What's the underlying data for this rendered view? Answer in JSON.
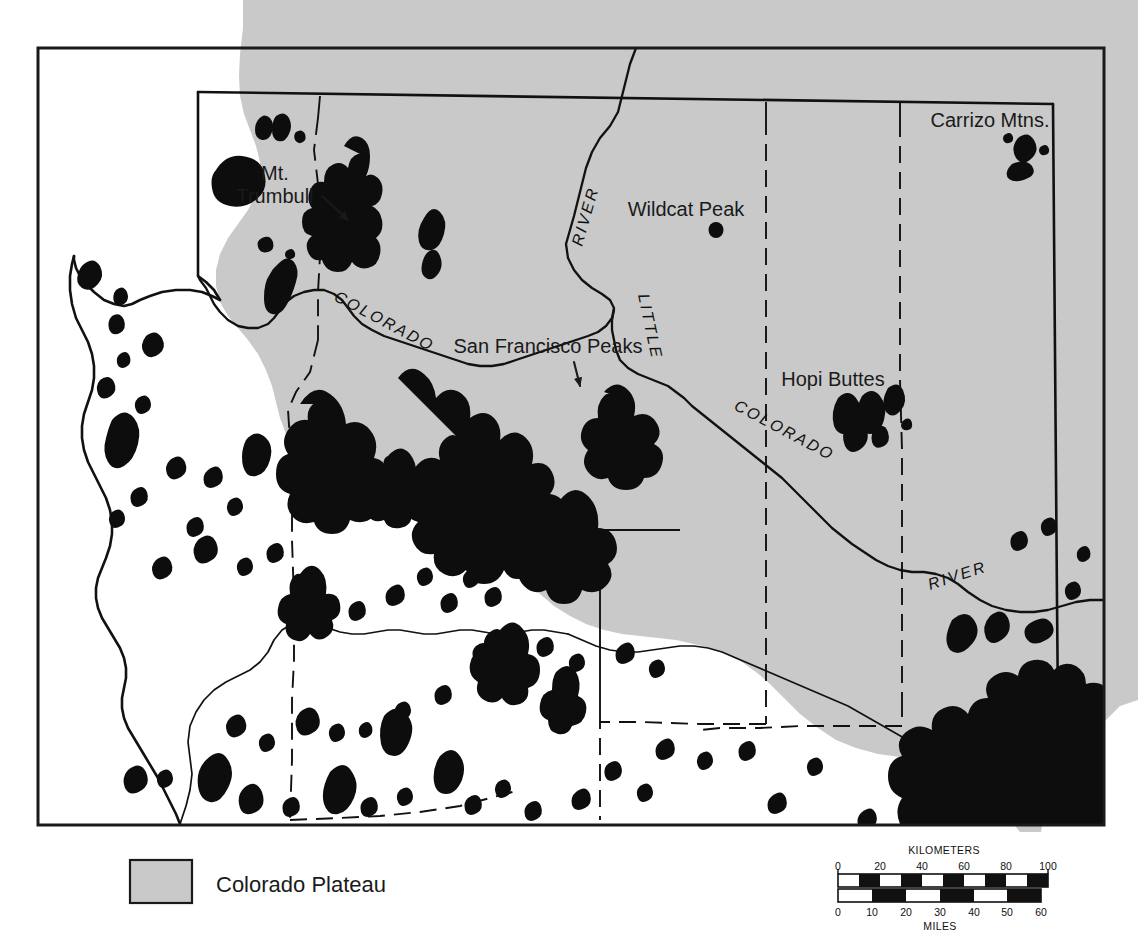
{
  "figure": {
    "background_color": "#ffffff",
    "frame_color": "#1a1a1a"
  },
  "map": {
    "plateau_color": "#c9c9c9",
    "volcanic_field_color": "#0d0d0d",
    "labels": [
      {
        "name": "mt-trumbull",
        "line1": "Mt.",
        "line2": "Trumbull"
      },
      {
        "name": "san-francisco-peaks",
        "text": "San Francisco Peaks"
      },
      {
        "name": "wildcat-peak",
        "text": "Wildcat Peak"
      },
      {
        "name": "hopi-buttes",
        "text": "Hopi Buttes"
      },
      {
        "name": "carrizo-mtns",
        "text": "Carrizo Mtns."
      }
    ],
    "river_labels": [
      {
        "name": "colorado-river-west",
        "text": "COLORADO"
      },
      {
        "name": "colorado-river-grand-canyon",
        "text": "RIVER"
      },
      {
        "name": "little-colorado-little",
        "text": "LITTLE"
      },
      {
        "name": "little-colorado-colorado",
        "text": "COLORADO"
      },
      {
        "name": "little-colorado-river",
        "text": "RIVER"
      }
    ]
  },
  "legend": {
    "swatch_color": "#c9c9c9",
    "label": "Colorado Plateau"
  },
  "scale_bar": {
    "kilometers": {
      "title": "KILOMETERS",
      "ticks": [
        "0",
        "20",
        "40",
        "60",
        "80",
        "100"
      ],
      "max": 100
    },
    "miles": {
      "title": "MILES",
      "ticks": [
        "0",
        "10",
        "20",
        "30",
        "40",
        "50",
        "60"
      ],
      "max": 60
    }
  }
}
